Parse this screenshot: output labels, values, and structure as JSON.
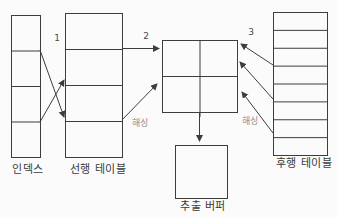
{
  "figure": {
    "background": "#fbfbfb",
    "line_color": "#3d3d3d",
    "text_color": "#3a3a3a",
    "number_color": "#4a4a4a",
    "hash_text_color": "#8f8f8f"
  },
  "nodes": {
    "index_table": {
      "label": "인덱스",
      "rows": 4,
      "cols": 1
    },
    "driving_table": {
      "label": "선행 테이블",
      "rows": 4,
      "cols": 1
    },
    "hash_grid": {
      "label": "",
      "rows": 2,
      "cols": 2
    },
    "extract_buffer": {
      "label": "추출 버퍼",
      "rows": 1,
      "cols": 1
    },
    "driven_table": {
      "label": "후행 테이블",
      "rows": 8,
      "cols": 1
    }
  },
  "annotations": {
    "step_1": "1",
    "step_2": "2",
    "step_3": "3",
    "hashing_left": "해싱",
    "hashing_right": "해싱"
  }
}
